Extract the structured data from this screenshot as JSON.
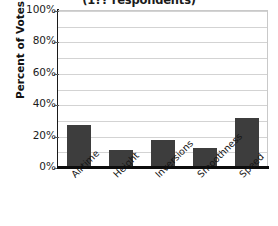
{
  "chart_data": {
    "type": "bar",
    "title": "(1?? respondents)",
    "title_note": "title is clipped by the top edge of the screenshot; only the parenthetical line is partly visible",
    "xlabel": "",
    "ylabel": "Percent of Votes",
    "categories": [
      "Airtime",
      "Height",
      "Inversions",
      "Smoothness",
      "Speed"
    ],
    "values": [
      27,
      11,
      17,
      12,
      31
    ],
    "ylim": [
      0,
      100
    ],
    "ytick_labels": [
      "0%",
      "20%",
      "40%",
      "60%",
      "80%",
      "100%"
    ],
    "ytick_values": [
      0,
      20,
      40,
      60,
      80,
      100
    ],
    "gridline_values": [
      10,
      20,
      30,
      40,
      50,
      60,
      70,
      80,
      90,
      100
    ],
    "grid": true,
    "legend": "none",
    "bar_color": "#3d3d3d",
    "gridline_color": "#d3d3d3",
    "axis_color": "#0d0d0d",
    "value_suffix": "%"
  }
}
